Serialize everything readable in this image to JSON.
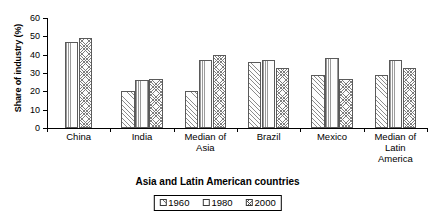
{
  "chart_data": {
    "type": "bar",
    "title": "",
    "xlabel": "Asia and Latin American countries",
    "ylabel": "Share of industry (%)",
    "ylim": [
      0,
      60
    ],
    "yticks": [
      0,
      10,
      20,
      30,
      40,
      50,
      60
    ],
    "grid": false,
    "legend_position": "bottom",
    "categories": [
      "China",
      "India",
      "Median of Asia",
      "Brazil",
      "Mexico",
      "Median of Latin America"
    ],
    "category_lines": [
      [
        "China"
      ],
      [
        "India"
      ],
      [
        "Median of",
        "Asia"
      ],
      [
        "Brazil"
      ],
      [
        "Mexico"
      ],
      [
        "Median of",
        "Latin",
        "America"
      ]
    ],
    "series": [
      {
        "name": "1960",
        "pattern": "diagonal-hatch",
        "values": [
          null,
          20,
          20,
          36,
          29,
          29
        ]
      },
      {
        "name": "1980",
        "pattern": "vertical-lines",
        "values": [
          47,
          26,
          37,
          37,
          38,
          37
        ]
      },
      {
        "name": "2000",
        "pattern": "cross-hatch",
        "values": [
          49,
          27,
          40,
          33,
          27,
          33
        ]
      }
    ]
  },
  "legend": {
    "items": [
      {
        "label": "1960"
      },
      {
        "label": "1980"
      },
      {
        "label": "2000"
      }
    ]
  }
}
